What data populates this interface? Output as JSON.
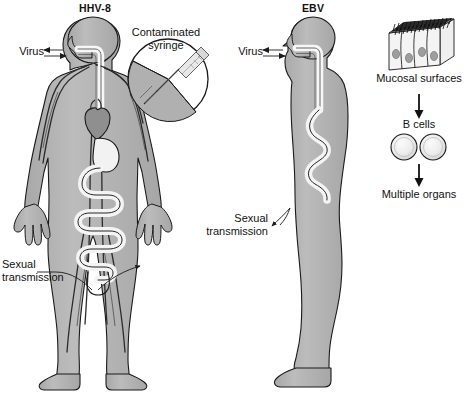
{
  "figure": {
    "type": "medical-illustration",
    "background_color": "#ffffff",
    "body_fill": "#b3b3b3",
    "outline_color": "#1a1a1a",
    "organ_light": "#f2f2f2",
    "organ_dark": "#8c8c8c"
  },
  "panels": [
    {
      "id": "hhv8",
      "title": "HHV-8",
      "view": "anterior full body",
      "labels": [
        {
          "name": "virus",
          "text": "Virus",
          "marker": "double-arrow-bidirectional",
          "points_to": "mouth / oral route"
        },
        {
          "name": "contaminated-syringe",
          "text": "Contaminated\nsyringe",
          "line1": "Contaminated",
          "line2": "syringe",
          "marker": "magnified-circle-inset",
          "points_to": "skin injection site"
        },
        {
          "name": "sexual-transmission",
          "text": "Sexual\ntransmission",
          "line1": "Sexual",
          "line2": "transmission",
          "marker": "leader-line-with-arrow",
          "points_to": "genital region"
        }
      ],
      "anatomy": [
        "head",
        "oral cavity",
        "trachea",
        "heart",
        "stomach",
        "intestines",
        "vasculature",
        "arms",
        "hands",
        "legs",
        "feet"
      ]
    },
    {
      "id": "ebv",
      "title": "EBV",
      "view": "lateral profile full body",
      "labels": [
        {
          "name": "virus",
          "text": "Virus",
          "marker": "double-arrow-bidirectional",
          "points_to": "mouth / oral route"
        },
        {
          "name": "sexual-transmission",
          "text": "Sexual\ntransmission",
          "line1": "Sexual",
          "line2": "transmission",
          "marker": "curved-arrow",
          "points_to": "genital region"
        }
      ],
      "anatomy": [
        "head",
        "oral cavity",
        "esophagus",
        "intestines",
        "legs",
        "foot"
      ]
    }
  ],
  "flowchart": {
    "id": "ebv-dissemination",
    "orientation": "vertical",
    "steps": [
      {
        "name": "mucosal-surfaces",
        "label": "Mucosal surfaces",
        "icon": "epithelial-cell-block-icon",
        "detail": "3D block of ciliated columnar epithelial cells"
      },
      {
        "name": "b-cells",
        "label": "B cells",
        "icon": "two-round-cells-icon",
        "count": 2
      },
      {
        "name": "multiple-organs",
        "label": "Multiple organs",
        "icon": null
      }
    ],
    "connectors": [
      {
        "from": "mucosal-surfaces",
        "to": "b-cells",
        "type": "down-arrow"
      },
      {
        "from": "b-cells",
        "to": "multiple-organs",
        "type": "down-arrow"
      }
    ]
  }
}
